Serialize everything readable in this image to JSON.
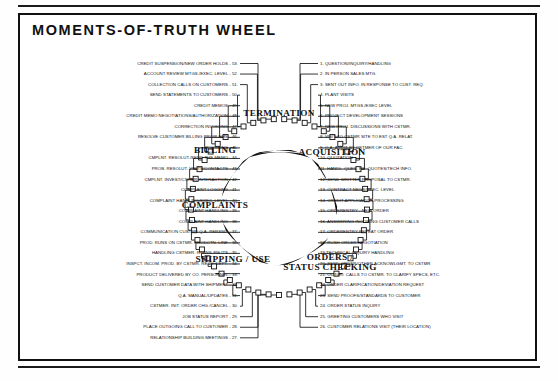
{
  "document": {
    "title": "MOMENTS-OF-TRUTH WHEEL"
  },
  "wheel": {
    "sections": [
      {
        "label": "TERMINATION",
        "x": 279,
        "y": 113
      },
      {
        "label": "ACQUISITION",
        "x": 332,
        "y": 152
      },
      {
        "label": "ORDERS /\nSTATUS CHECKING",
        "x": 330,
        "y": 262
      },
      {
        "label": "SHIPPING / USE",
        "x": 233,
        "y": 259
      },
      {
        "label": "COMPLAINTS",
        "x": 215,
        "y": 205
      },
      {
        "label": "BILLING",
        "x": 215,
        "y": 150
      }
    ],
    "right_items": [
      {
        "n": 1,
        "text": "1. QUESTION/INQUIRY/HANDLING"
      },
      {
        "n": 2,
        "text": "2. IN PERSON SALES MTG."
      },
      {
        "n": 3,
        "text": "3. SENT OUT INFO. IN RESPONSE TO CUST. REQ."
      },
      {
        "n": 4,
        "text": "4. PLANT VISITS"
      },
      {
        "n": 5,
        "text": "5. NEW PROJ. MTGS./EXEC LEVEL"
      },
      {
        "n": 6,
        "text": "6. PROJECT DEVELOPMENT SESSIONS"
      },
      {
        "n": 7,
        "text": "7. NEW PROJ. DISCUSSIONS WITH CSTMR."
      },
      {
        "n": 8,
        "text": "8. VISIT TO CSTMR SITE TO EST Q.A. RELAT."
      },
      {
        "n": 9,
        "text": "9. Q.A. AUDIT BY CSTMER OF OUR FAC."
      },
      {
        "n": 10,
        "text": "10. QUOTATION"
      },
      {
        "n": 11,
        "text": "11. HANDL. QUES. RE. QUOTES/TECH INFO."
      },
      {
        "n": 12,
        "text": "12. SEND WRITTEN PROPOSAL TO CSTMR."
      },
      {
        "n": 13,
        "text": "13. CONTRACT NEGS/EXEC. LEVEL"
      },
      {
        "n": 14,
        "text": "14. CREDIT APPLICATION PROCESSING"
      },
      {
        "n": 15,
        "text": "15. ORDERENTRY - NEW ORDER"
      },
      {
        "n": 16,
        "text": "16. ANSWERING INCOMING CUSTOMER CALLS"
      },
      {
        "n": 17,
        "text": "17. ORDERENTRY-REPEAT ORDER"
      },
      {
        "n": 18,
        "text": "18. RUSH ORDER NEGOTIATION"
      },
      {
        "n": 19,
        "text": "19 TECHNICAL INQUIRY HANDLING"
      },
      {
        "n": 20,
        "text": "20. SEND ORDER/OTHER ACKNOWLGMT. TO CSTMR"
      },
      {
        "n": 21,
        "text": "21. OUTGO. CALLS TO CSTMR. TO CLARIFY SPECS, ETC."
      },
      {
        "n": 22,
        "text": "22. ORDER CLARIFICATION/DEVIATION REQUEST"
      },
      {
        "n": 23,
        "text": "23. SEND PROOFS/STANDARDS TO CUSTOMER"
      },
      {
        "n": 24,
        "text": "24. ORDER STATUS INQUIRY"
      },
      {
        "n": 25,
        "text": "25. GREETING CUSTOMERS WHO VISIT"
      },
      {
        "n": 26,
        "text": "26. CUSTOMER RELATIONS VISIT (THEIR LOCATION)"
      }
    ],
    "left_items": [
      {
        "n": 53,
        "text": "CREDIT SUSPENSION/NEW ORDER HOLDS - 53."
      },
      {
        "n": 52,
        "text": "ACCOUNT REVIEW MTGS./EXEC. LEVEL - 52."
      },
      {
        "n": 51,
        "text": "COLLECTION CALLS ON CUSTOMERS - 51."
      },
      {
        "n": 50,
        "text": "SEND STATEMENTS TO CUSTOMERS - 50."
      },
      {
        "n": 49,
        "text": "CREDIT MEMOS - 49."
      },
      {
        "n": 48,
        "text": "CREDIT MEMO NEGOTIATIONS/AUTHORIZATION - 48."
      },
      {
        "n": 47,
        "text": "CORRECTION INVOICING - 47."
      },
      {
        "n": 46,
        "text": "RESOLVE CUSTOMER BILLING PROBLEMS - 46."
      },
      {
        "n": 45,
        "text": "INVOICING - 45."
      },
      {
        "n": 44,
        "text": "CMPLNT. RESOLUT./SEND THE MEMO - 44."
      },
      {
        "n": 43,
        "text": "PROB. RESOLUT. VISITS/CONTACTS - 43."
      },
      {
        "n": 42,
        "text": "CMPLNT. INVEST/CSTMR INTERACTION - 42."
      },
      {
        "n": 41,
        "text": "COMPLAINT LOGGING - 41."
      },
      {
        "n": 40,
        "text": "COMPLAINT HANDLING/EXEC. LEVEL - 40."
      },
      {
        "n": 39,
        "text": "COMPLAINT HANDLING - 39."
      },
      {
        "n": 38,
        "text": "COMPLAINT HANDLING - 38."
      },
      {
        "n": 37,
        "text": "COMMUNICATION CUSTMR Q.A. PERSNL. - 37."
      },
      {
        "n": 36,
        "text": "PROD. RUNS ON CSTMR. PRODCTN. LINE - 36."
      },
      {
        "n": 35,
        "text": "HANDLING CSTMER. RTRNS./REJTS - 35."
      },
      {
        "n": 34,
        "text": "INSPCT. INCOM. PROD. BY CSTMR. RECV. DEPT. - 34."
      },
      {
        "n": 33,
        "text": "PRODUCT DELIVERED BY CO. PERSONNEL - 33."
      },
      {
        "n": 32,
        "text": "SEND CUSTOMER DATA WITH SHIPMENT - 32."
      },
      {
        "n": 31,
        "text": "Q.A. MANUAL/UPDATES - 31."
      },
      {
        "n": 30,
        "text": "CSTMER. INIT. ORDER CHG./CANCEL - 30."
      },
      {
        "n": 29,
        "text": "JOB STATUS REPORT - 29."
      },
      {
        "n": 28,
        "text": "PLACE OUTGOING CALL TO CUSTOMER - 28."
      },
      {
        "n": 27,
        "text": "RELATIONSHIP BUILDING MEETINGS - 27."
      }
    ],
    "colors": {
      "ink": "#111111",
      "paper": "#ffffff"
    }
  }
}
